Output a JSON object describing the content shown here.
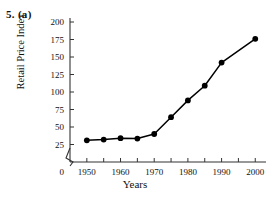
{
  "figure": {
    "question_label": "5.  (a)",
    "x_axis_title": "Years",
    "y_axis_title": "Retail Price Index"
  },
  "chart_data": {
    "type": "line",
    "title": "",
    "xlabel": "Years",
    "ylabel": "Retail Price Index",
    "x": [
      1950,
      1955,
      1960,
      1965,
      1970,
      1975,
      1980,
      1985,
      1990,
      2000
    ],
    "values": [
      31,
      32,
      34,
      33.5,
      40,
      64,
      88,
      109,
      142,
      176
    ],
    "xlim": [
      1945,
      2002
    ],
    "ylim": [
      0,
      200
    ],
    "y_ticks": [
      0,
      25,
      50,
      75,
      100,
      125,
      150,
      175,
      200
    ],
    "y_tick_labels": [
      "0",
      "25",
      "50",
      "75",
      "100",
      "125",
      "150",
      "175",
      "200"
    ],
    "x_ticks": [
      1950,
      1955,
      1960,
      1965,
      1970,
      1975,
      1980,
      1985,
      1990,
      1995,
      2000
    ],
    "x_tick_labels": [
      "1950",
      "",
      "1960",
      "",
      "1970",
      "",
      "1980",
      "",
      "1990",
      "",
      "2000"
    ],
    "x_major_labels": [
      "1950",
      "1960",
      "1970",
      "1980",
      "1990",
      "2000"
    ],
    "grid": false,
    "legend": null,
    "marker": "filled-circle",
    "axis_break": true,
    "axis_break_location": "y-axis between 0 and 25",
    "line_color": "#000000",
    "marker_color": "#000000",
    "axis_color": "#333333",
    "background_color": "#ffffff"
  }
}
